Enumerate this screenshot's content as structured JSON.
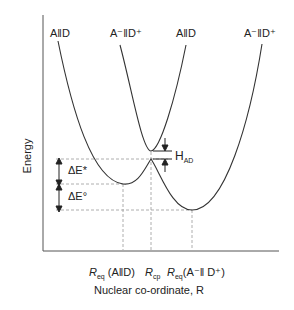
{
  "diagram": {
    "type": "potential-energy-curves",
    "y_axis_label": "Energy",
    "x_axis_label": "Nuclear co-ordinate, R",
    "curve_labels": [
      {
        "id": "left-reactant",
        "text": "A‖D"
      },
      {
        "id": "left-product",
        "text": "A⁻‖D⁺"
      },
      {
        "id": "right-reactant",
        "text": "A‖D"
      },
      {
        "id": "right-product",
        "text": "A⁻‖D⁺"
      }
    ],
    "energy_annotations": {
      "activation": "ΔE*",
      "reaction": "ΔE°",
      "coupling": "H",
      "coupling_sub": "AD"
    },
    "x_tick_labels": {
      "req_reactant_main": "R",
      "req_reactant_sub": "eq",
      "req_reactant_arg": " (A‖D)",
      "rcp_main": "R",
      "rcp_sub": "cp",
      "req_product_main": "R",
      "req_product_sub": "eq",
      "req_product_arg": "(A⁻‖ D⁺)"
    },
    "colors": {
      "line": "#333333",
      "dash": "#888888"
    }
  }
}
